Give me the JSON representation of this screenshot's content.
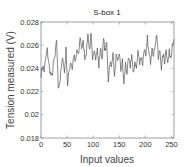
{
  "chart_data": {
    "type": "line",
    "title": "S-box 1",
    "xlabel": "Input values",
    "ylabel": "Tension measured (V)",
    "xlim": [
      0,
      255
    ],
    "ylim": [
      0.018,
      0.028
    ],
    "xticks": [
      0,
      50,
      100,
      150,
      200,
      250
    ],
    "xtick_labels": [
      "0",
      "50",
      "100",
      "150",
      "200",
      "250"
    ],
    "yticks": [
      0.018,
      0.02,
      0.022,
      0.024,
      0.026,
      0.028
    ],
    "ytick_labels": [
      "0.018",
      "0.02",
      "0.022",
      "0.024",
      "0.026",
      "0.028"
    ],
    "grid": false,
    "legend": null,
    "line_color": "#555555",
    "series": [
      {
        "name": "S-box 1",
        "keypoints_x": [
          0,
          3,
          6,
          9,
          12,
          15,
          18,
          21,
          24,
          27,
          30,
          33,
          36,
          39,
          42,
          45,
          48,
          51,
          54,
          57,
          60,
          63,
          66,
          69,
          72,
          75,
          78,
          81,
          84,
          87,
          90,
          93,
          96,
          99,
          102,
          105,
          108,
          111,
          114,
          117,
          120,
          123,
          126,
          129,
          132,
          135,
          138,
          141,
          144,
          147,
          150,
          153,
          156,
          159,
          162,
          165,
          168,
          171,
          174,
          177,
          180,
          183,
          186,
          189,
          192,
          195,
          198,
          201,
          204,
          207,
          210,
          213,
          216,
          219,
          222,
          225,
          228,
          231,
          234,
          237,
          240,
          243,
          246,
          249,
          252,
          255
        ],
        "keypoints_y": [
          0.0235,
          0.0242,
          0.0238,
          0.0248,
          0.0256,
          0.0244,
          0.0236,
          0.0232,
          0.0245,
          0.025,
          0.0265,
          0.0224,
          0.0228,
          0.024,
          0.025,
          0.0236,
          0.0256,
          0.0226,
          0.0238,
          0.0246,
          0.024,
          0.0252,
          0.0244,
          0.0256,
          0.025,
          0.0268,
          0.0258,
          0.0262,
          0.025,
          0.0254,
          0.0269,
          0.0256,
          0.0268,
          0.0245,
          0.0258,
          0.025,
          0.0256,
          0.0242,
          0.0258,
          0.0248,
          0.0265,
          0.0255,
          0.0262,
          0.023,
          0.0246,
          0.024,
          0.0256,
          0.0232,
          0.025,
          0.0244,
          0.0254,
          0.0238,
          0.0246,
          0.0226,
          0.0244,
          0.0236,
          0.0248,
          0.0242,
          0.0252,
          0.0234,
          0.0246,
          0.024,
          0.0254,
          0.0246,
          0.025,
          0.0244,
          0.0258,
          0.0248,
          0.0266,
          0.0252,
          0.0246,
          0.026,
          0.025,
          0.0262,
          0.027,
          0.0248,
          0.0256,
          0.024,
          0.0252,
          0.0246,
          0.0258,
          0.0244,
          0.0254,
          0.025,
          0.0262,
          0.0265
        ]
      }
    ]
  },
  "labels": {
    "title": "S-box 1",
    "xlabel": "Input values",
    "ylabel": "Tension measured (V)"
  }
}
